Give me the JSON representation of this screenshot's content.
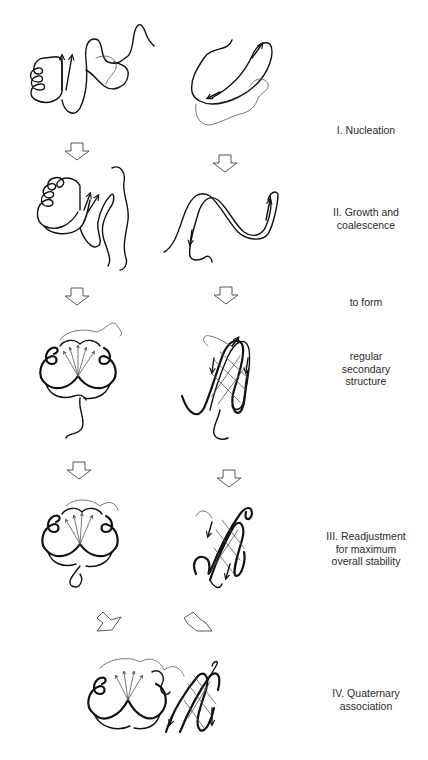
{
  "figure": {
    "type": "protein folding pathway diagram",
    "columns": [
      "alpha-helical domain (left)",
      "beta-sheet domain (right)"
    ],
    "stages": [
      {
        "id": "stage-1",
        "label": "I. Nucleation",
        "y": 130
      },
      {
        "id": "stage-2",
        "label": "II. Growth and\ncoalescence",
        "y": 217
      },
      {
        "id": "stage-2b",
        "label": "to form",
        "y": 302
      },
      {
        "id": "stage-2c",
        "label": "regular\nsecondary\nstructure",
        "y": 367
      },
      {
        "id": "stage-3",
        "label": "III. Readjustment\nfor maximum\noverall stability",
        "y": 535
      },
      {
        "id": "stage-4",
        "label": "IV. Quaternary\nassociation",
        "y": 692
      }
    ],
    "arrows": [
      {
        "name": "down-arrow-left-1",
        "x": 77,
        "y": 148
      },
      {
        "name": "down-arrow-right-1",
        "x": 225,
        "y": 160
      },
      {
        "name": "down-arrow-left-2",
        "x": 77,
        "y": 290
      },
      {
        "name": "down-arrow-right-2",
        "x": 226,
        "y": 290
      },
      {
        "name": "down-arrow-left-3",
        "x": 79,
        "y": 462
      },
      {
        "name": "down-arrow-right-3",
        "x": 229,
        "y": 470
      },
      {
        "name": "diagonal-arrow-left",
        "x": 107,
        "y": 612
      },
      {
        "name": "diagonal-arrow-right",
        "x": 197,
        "y": 612
      }
    ],
    "colors": {
      "ink": "#111111",
      "background": "#ffffff",
      "text": "#2a2a2a"
    }
  }
}
